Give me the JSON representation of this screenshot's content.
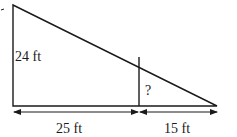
{
  "diagram": {
    "type": "similar-triangles",
    "labels": {
      "height": "24 ft",
      "unknown": "?",
      "base_left": "25 ft",
      "base_right": "15 ft"
    },
    "colors": {
      "stroke": "#1a1a1a",
      "background": "#ffffff"
    }
  }
}
